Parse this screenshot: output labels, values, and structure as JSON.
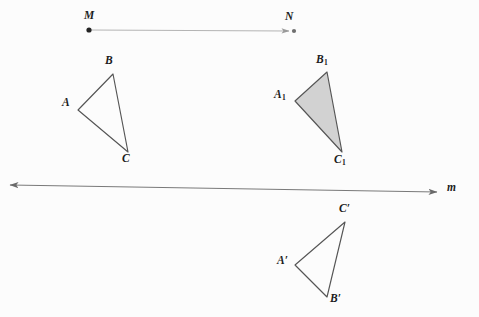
{
  "figure": {
    "background_color": "#fcfcfc",
    "stroke_color": "#555555",
    "fill_color": "#d2d2d2",
    "vector_color": "#b4b4b4",
    "label_color": "#1d1d1d",
    "width": 479,
    "height": 317
  },
  "vector_mn": {
    "name": "translation-vector",
    "start_label": "M",
    "end_label": "N",
    "start_point": {
      "x": 89,
      "y": 30
    },
    "end_point": {
      "x": 289,
      "y": 31
    },
    "start_label_pos": {
      "x": 84,
      "y": 10
    },
    "end_label_pos": {
      "x": 285,
      "y": 11
    },
    "has_start_dot": true,
    "has_end_dot": true,
    "has_arrowhead": true
  },
  "line_m": {
    "name": "mirror-line",
    "label": "m",
    "start_point": {
      "x": 10,
      "y": 185
    },
    "end_point": {
      "x": 437,
      "y": 192
    },
    "label_pos": {
      "x": 447,
      "y": 182
    },
    "double_headed": true
  },
  "triangles": [
    {
      "id": "abc",
      "name": "triangle-abc",
      "filled": false,
      "vertices": [
        {
          "label": "A",
          "x": 78,
          "y": 110,
          "label_pos": {
            "x": 62,
            "y": 97
          }
        },
        {
          "label": "B",
          "x": 113,
          "y": 74,
          "label_pos": {
            "x": 105,
            "y": 55
          }
        },
        {
          "label": "C",
          "x": 128,
          "y": 152,
          "label_pos": {
            "x": 122,
            "y": 153
          }
        }
      ]
    },
    {
      "id": "a1b1c1",
      "name": "triangle-a1b1c1",
      "filled": true,
      "vertices": [
        {
          "label": "A",
          "sub": "1",
          "x": 295,
          "y": 101,
          "label_pos": {
            "x": 274,
            "y": 89
          }
        },
        {
          "label": "B",
          "sub": "1",
          "x": 327,
          "y": 72,
          "label_pos": {
            "x": 316,
            "y": 54
          }
        },
        {
          "label": "C",
          "sub": "1",
          "x": 342,
          "y": 152,
          "label_pos": {
            "x": 334,
            "y": 154
          }
        }
      ]
    },
    {
      "id": "aprime",
      "name": "triangle-a-prime-b-prime-c-prime",
      "filled": false,
      "vertices": [
        {
          "label": "A",
          "prime": "′",
          "x": 295,
          "y": 265,
          "label_pos": {
            "x": 277,
            "y": 255
          }
        },
        {
          "label": "B",
          "prime": "′",
          "x": 327,
          "y": 297,
          "label_pos": {
            "x": 330,
            "y": 293
          }
        },
        {
          "label": "C",
          "prime": "′",
          "x": 345,
          "y": 222,
          "label_pos": {
            "x": 339,
            "y": 203
          }
        }
      ]
    }
  ]
}
